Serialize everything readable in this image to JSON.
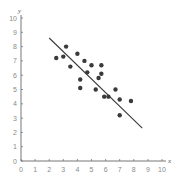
{
  "chart_data": {
    "type": "scatter",
    "title": "",
    "xlabel": "x",
    "ylabel": "y",
    "xlim": [
      0,
      10
    ],
    "ylim": [
      0,
      10
    ],
    "grid": false,
    "x_ticks": [
      "0",
      "1",
      "2",
      "3",
      "4",
      "5",
      "6",
      "7",
      "8",
      "9",
      "10"
    ],
    "y_ticks": [
      "0",
      "1",
      "2",
      "3",
      "4",
      "5",
      "6",
      "7",
      "8",
      "9",
      "10"
    ],
    "series": [
      {
        "name": "observations",
        "points": [
          [
            2.5,
            7.2
          ],
          [
            3.0,
            7.3
          ],
          [
            3.2,
            8.0
          ],
          [
            3.5,
            6.6
          ],
          [
            4.0,
            7.5
          ],
          [
            4.2,
            5.7
          ],
          [
            4.2,
            5.1
          ],
          [
            4.5,
            7.0
          ],
          [
            4.7,
            6.2
          ],
          [
            5.0,
            6.7
          ],
          [
            5.3,
            5.0
          ],
          [
            5.5,
            5.8
          ],
          [
            5.7,
            6.7
          ],
          [
            5.7,
            6.1
          ],
          [
            5.9,
            4.5
          ],
          [
            6.2,
            4.5
          ],
          [
            6.7,
            5.0
          ],
          [
            7.0,
            4.3
          ],
          [
            7.0,
            3.2
          ],
          [
            7.8,
            4.2
          ]
        ]
      }
    ],
    "trend_line": {
      "name": "regression line",
      "from": [
        2.0,
        8.6
      ],
      "to": [
        8.6,
        2.3
      ]
    }
  },
  "colors": {
    "axis": "#777777",
    "points": "#3a3a3a",
    "line": "#3a3a3a",
    "labels": "#8a8a8a"
  }
}
